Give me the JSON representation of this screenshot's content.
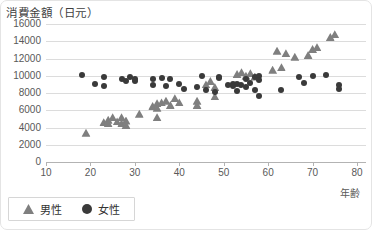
{
  "title": "消費金額（日元）",
  "x_axis_title": "年齢",
  "legend": {
    "male_label": "男性",
    "female_label": "女性"
  },
  "colors": {
    "male": "#7f7f7f",
    "female": "#3a3a3a",
    "grid": "#dcdcdc",
    "axis": "#b3b3b3",
    "label_text": "#595959",
    "title_text": "#3f3f3f"
  },
  "chart_data": {
    "type": "scatter",
    "title": "消費金額（日元）",
    "xlabel": "年齢",
    "ylabel": "消費金額（日元）",
    "xlim": [
      10,
      80
    ],
    "ylim": [
      0,
      16000
    ],
    "x_ticks": [
      10,
      20,
      30,
      40,
      50,
      60,
      70,
      80
    ],
    "y_ticks": [
      0,
      2000,
      4000,
      6000,
      8000,
      10000,
      12000,
      14000,
      16000
    ],
    "grid": "horizontal",
    "legend_position": "bottom-left",
    "series": [
      {
        "name": "男性",
        "marker": "triangle",
        "color": "#7f7f7f",
        "points": [
          [
            19,
            3400
          ],
          [
            23,
            4600
          ],
          [
            24,
            4900
          ],
          [
            24,
            4500
          ],
          [
            25,
            5200
          ],
          [
            26,
            4700
          ],
          [
            27,
            5200
          ],
          [
            27,
            4500
          ],
          [
            28,
            4800
          ],
          [
            28,
            4300
          ],
          [
            31,
            5600
          ],
          [
            34,
            6500
          ],
          [
            35,
            6800
          ],
          [
            35,
            5200
          ],
          [
            35,
            6300
          ],
          [
            36,
            6900
          ],
          [
            37,
            7100
          ],
          [
            38,
            6600
          ],
          [
            39,
            7400
          ],
          [
            40,
            6900
          ],
          [
            44,
            7100
          ],
          [
            44,
            6600
          ],
          [
            46,
            9000
          ],
          [
            47,
            9400
          ],
          [
            48,
            8700
          ],
          [
            48,
            7600
          ],
          [
            53,
            10200
          ],
          [
            54,
            10400
          ],
          [
            55,
            10000
          ],
          [
            56,
            10300
          ],
          [
            57,
            9900
          ],
          [
            61,
            10700
          ],
          [
            62,
            12900
          ],
          [
            63,
            11000
          ],
          [
            64,
            12600
          ],
          [
            66,
            12200
          ],
          [
            69,
            12400
          ],
          [
            70,
            13100
          ],
          [
            71,
            13300
          ],
          [
            74,
            14500
          ],
          [
            75,
            14800
          ]
        ]
      },
      {
        "name": "女性",
        "marker": "circle",
        "color": "#3a3a3a",
        "points": [
          [
            18,
            10100
          ],
          [
            21,
            9100
          ],
          [
            23,
            9900
          ],
          [
            23,
            8800
          ],
          [
            27,
            9600
          ],
          [
            28,
            9400
          ],
          [
            29,
            9800
          ],
          [
            30,
            9400
          ],
          [
            30,
            9600
          ],
          [
            34,
            9600
          ],
          [
            34,
            8900
          ],
          [
            36,
            9700
          ],
          [
            37,
            8800
          ],
          [
            38,
            9600
          ],
          [
            40,
            9100
          ],
          [
            41,
            8500
          ],
          [
            44,
            8700
          ],
          [
            45,
            10000
          ],
          [
            46,
            8400
          ],
          [
            48,
            8100
          ],
          [
            49,
            9900
          ],
          [
            49,
            9700
          ],
          [
            51,
            8900
          ],
          [
            52,
            9100
          ],
          [
            52,
            8800
          ],
          [
            53,
            9000
          ],
          [
            53,
            8200
          ],
          [
            54,
            8900
          ],
          [
            55,
            9600
          ],
          [
            55,
            8700
          ],
          [
            56,
            9200
          ],
          [
            57,
            9800
          ],
          [
            57,
            8400
          ],
          [
            58,
            10000
          ],
          [
            58,
            9500
          ],
          [
            58,
            7700
          ],
          [
            63,
            8400
          ],
          [
            67,
            9800
          ],
          [
            68,
            9200
          ],
          [
            70,
            10000
          ],
          [
            73,
            10100
          ],
          [
            76,
            8900
          ],
          [
            76,
            8500
          ]
        ]
      }
    ]
  }
}
